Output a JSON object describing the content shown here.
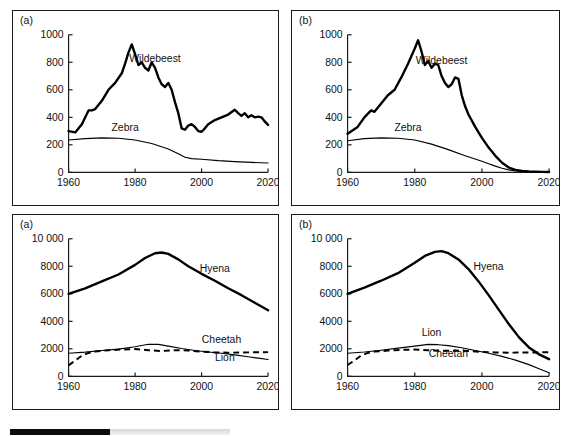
{
  "figure": {
    "background": "#ffffff",
    "line_color": "#000000",
    "panels": [
      {
        "id": "panel-tl",
        "tag": "(a)"
      },
      {
        "id": "panel-tr",
        "tag": "(b)"
      },
      {
        "id": "panel-bl",
        "tag": "(a)"
      },
      {
        "id": "panel-br",
        "tag": "(b)"
      }
    ],
    "bottom_strip": {
      "dark_color": "#0d0d0d",
      "light_color": "#e4e4e4"
    }
  },
  "chart_data": [
    {
      "panel": "(a)",
      "position": "top-left",
      "type": "line",
      "title": "",
      "xlabel": "",
      "ylabel": "",
      "xlim": [
        1960,
        2020
      ],
      "ylim": [
        0,
        1000
      ],
      "xticks": [
        1960,
        1980,
        2000,
        2020
      ],
      "xticklabels": [
        "1960",
        "1980",
        "2000",
        "2020"
      ],
      "yticks": [
        0,
        200,
        400,
        600,
        800,
        1000
      ],
      "yticklabels": [
        "0",
        "200",
        "400",
        "600",
        "800",
        "1000"
      ],
      "grid": false,
      "legend": "inline-annotation",
      "series": [
        {
          "name": "Wildebeest",
          "style": "solid-thick",
          "label_x": 1986,
          "label_y": 800,
          "x": [
            1960,
            1962,
            1964,
            1966,
            1967,
            1968,
            1970,
            1972,
            1974,
            1976,
            1977,
            1978,
            1979,
            1980,
            1981,
            1982,
            1983,
            1984,
            1985,
            1986,
            1987,
            1988,
            1989,
            1990,
            1991,
            1992,
            1993,
            1994,
            1995,
            1996,
            1997,
            1998,
            1999,
            2000,
            2001,
            2002,
            2004,
            2006,
            2008,
            2010,
            2011,
            2012,
            2013,
            2014,
            2015,
            2016,
            2017,
            2018,
            2019,
            2020
          ],
          "y": [
            300,
            290,
            350,
            450,
            450,
            460,
            520,
            600,
            650,
            720,
            790,
            870,
            930,
            860,
            780,
            800,
            760,
            740,
            800,
            760,
            690,
            640,
            620,
            650,
            600,
            510,
            430,
            320,
            310,
            340,
            350,
            330,
            300,
            295,
            320,
            350,
            380,
            400,
            420,
            455,
            430,
            410,
            430,
            400,
            415,
            400,
            405,
            400,
            370,
            345
          ]
        },
        {
          "name": "Zebra",
          "style": "solid-thin",
          "label_x": 1977,
          "label_y": 300,
          "x": [
            1960,
            1965,
            1970,
            1975,
            1980,
            1985,
            1990,
            1993,
            1995,
            1997,
            2000,
            2005,
            2010,
            2015,
            2020
          ],
          "y": [
            235,
            245,
            250,
            248,
            235,
            210,
            170,
            135,
            110,
            100,
            95,
            85,
            78,
            72,
            68
          ]
        }
      ]
    },
    {
      "panel": "(b)",
      "position": "top-right",
      "type": "line",
      "title": "",
      "xlabel": "",
      "ylabel": "",
      "xlim": [
        1960,
        2020
      ],
      "ylim": [
        0,
        1000
      ],
      "xticks": [
        1960,
        1980,
        2000,
        2020
      ],
      "xticklabels": [
        "1960",
        "1980",
        "2000",
        "2020"
      ],
      "yticks": [
        0,
        200,
        400,
        600,
        800,
        1000
      ],
      "yticklabels": [
        "0",
        "200",
        "400",
        "600",
        "800",
        "1000"
      ],
      "grid": false,
      "legend": "inline-annotation",
      "series": [
        {
          "name": "Wildebeest",
          "style": "solid-thick",
          "label_x": 1988,
          "label_y": 790,
          "x": [
            1960,
            1963,
            1965,
            1967,
            1968,
            1970,
            1972,
            1974,
            1976,
            1978,
            1980,
            1981,
            1982,
            1983,
            1984,
            1985,
            1986,
            1987,
            1988,
            1989,
            1990,
            1991,
            1992,
            1993,
            1994,
            1995,
            1996,
            1998,
            2000,
            2002,
            2004,
            2006,
            2008,
            2010,
            2012,
            2014,
            2016,
            2018,
            2020
          ],
          "y": [
            280,
            330,
            400,
            450,
            440,
            500,
            560,
            600,
            690,
            790,
            900,
            960,
            880,
            780,
            810,
            760,
            790,
            780,
            700,
            650,
            620,
            640,
            690,
            680,
            560,
            480,
            420,
            330,
            250,
            180,
            120,
            70,
            35,
            18,
            10,
            6,
            4,
            3,
            2
          ]
        },
        {
          "name": "Zebra",
          "style": "solid-thin",
          "label_x": 1978,
          "label_y": 300,
          "x": [
            1960,
            1965,
            1970,
            1975,
            1980,
            1985,
            1990,
            1995,
            2000,
            2002,
            2004,
            2006,
            2008,
            2010,
            2012,
            2015,
            2020
          ],
          "y": [
            230,
            245,
            250,
            248,
            235,
            205,
            165,
            120,
            80,
            62,
            45,
            30,
            18,
            10,
            6,
            3,
            2
          ]
        }
      ]
    },
    {
      "panel": "(a)",
      "position": "bottom-left",
      "type": "line",
      "title": "",
      "xlabel": "",
      "ylabel": "",
      "xlim": [
        1960,
        2020
      ],
      "ylim": [
        0,
        10000
      ],
      "xticks": [
        1960,
        1980,
        2000,
        2020
      ],
      "xticklabels": [
        "1960",
        "1980",
        "2000",
        "2020"
      ],
      "yticks": [
        0,
        2000,
        4000,
        6000,
        8000,
        10000
      ],
      "yticklabels": [
        "0",
        "2000",
        "4000",
        "6000",
        "8000",
        "10 000"
      ],
      "grid": false,
      "legend": "inline-annotation",
      "series": [
        {
          "name": "Hyena",
          "style": "solid-thick",
          "label_x": 2004,
          "label_y": 7600,
          "x": [
            1960,
            1965,
            1970,
            1975,
            1980,
            1983,
            1986,
            1988,
            1990,
            1993,
            1996,
            2000,
            2004,
            2008,
            2012,
            2016,
            2020
          ],
          "y": [
            6000,
            6400,
            6900,
            7400,
            8100,
            8600,
            8950,
            9000,
            8900,
            8500,
            8000,
            7450,
            6950,
            6400,
            5900,
            5350,
            4800
          ]
        },
        {
          "name": "Cheetah",
          "style": "dashed",
          "label_x": 2006,
          "label_y": 2450,
          "x": [
            1960,
            1962,
            1964,
            1966,
            1968,
            1972,
            1976,
            1980,
            1984,
            1988,
            1992,
            1996,
            2000,
            2004,
            2008,
            2012,
            2016,
            2020
          ],
          "y": [
            800,
            1150,
            1500,
            1700,
            1800,
            1900,
            1950,
            1980,
            1900,
            1840,
            1900,
            1880,
            1790,
            1740,
            1720,
            1730,
            1750,
            1760
          ]
        },
        {
          "name": "Lion",
          "style": "solid-thin",
          "label_x": 2007,
          "label_y": 1150,
          "x": [
            1960,
            1965,
            1970,
            1975,
            1980,
            1984,
            1987,
            1990,
            1994,
            1998,
            2002,
            2006,
            2010,
            2014,
            2017,
            2020
          ],
          "y": [
            1680,
            1760,
            1880,
            1980,
            2150,
            2330,
            2320,
            2200,
            2020,
            1880,
            1770,
            1680,
            1560,
            1420,
            1320,
            1220
          ]
        }
      ]
    },
    {
      "panel": "(b)",
      "position": "bottom-right",
      "type": "line",
      "title": "",
      "xlabel": "",
      "ylabel": "",
      "xlim": [
        1960,
        2020
      ],
      "ylim": [
        0,
        10000
      ],
      "xticks": [
        1960,
        1980,
        2000,
        2020
      ],
      "xticklabels": [
        "1960",
        "1980",
        "2000",
        "2020"
      ],
      "yticks": [
        0,
        2000,
        4000,
        6000,
        8000,
        10000
      ],
      "yticklabels": [
        "0",
        "2000",
        "4000",
        "6000",
        "8000",
        "10 000"
      ],
      "grid": false,
      "legend": "inline-annotation",
      "series": [
        {
          "name": "Hyena",
          "style": "solid-thick",
          "label_x": 2002,
          "label_y": 7700,
          "x": [
            1960,
            1965,
            1970,
            1975,
            1980,
            1983,
            1986,
            1988,
            1990,
            1993,
            1996,
            1999,
            2002,
            2005,
            2008,
            2011,
            2014,
            2017,
            2020
          ],
          "y": [
            6000,
            6450,
            6950,
            7500,
            8250,
            8750,
            9050,
            9100,
            8950,
            8500,
            7800,
            6900,
            5900,
            4850,
            3800,
            2850,
            2100,
            1600,
            1250
          ]
        },
        {
          "name": "Lion",
          "style": "solid-thin",
          "label_x": 1985,
          "label_y": 2950,
          "x": [
            1960,
            1965,
            1970,
            1975,
            1980,
            1984,
            1987,
            1990,
            1994,
            1998,
            2002,
            2006,
            2010,
            2014,
            2017,
            2020
          ],
          "y": [
            1680,
            1770,
            1900,
            2050,
            2200,
            2320,
            2300,
            2230,
            2080,
            1880,
            1680,
            1450,
            1180,
            850,
            550,
            260
          ]
        },
        {
          "name": "Cheetah",
          "style": "dashed",
          "label_x": 1990,
          "label_y": 1380,
          "x": [
            1960,
            1962,
            1964,
            1966,
            1968,
            1972,
            1976,
            1980,
            1984,
            1988,
            1992,
            1996,
            2000,
            2004,
            2008,
            2012,
            2016,
            2020
          ],
          "y": [
            820,
            1150,
            1500,
            1700,
            1800,
            1870,
            1920,
            1950,
            1900,
            1850,
            1870,
            1840,
            1780,
            1740,
            1720,
            1730,
            1740,
            1750
          ]
        }
      ]
    }
  ]
}
